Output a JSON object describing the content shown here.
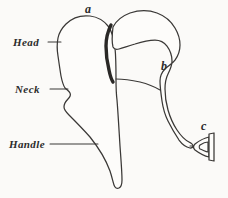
{
  "figure": {
    "background_color": "#fbfaf8",
    "ink_color": "#3a3836",
    "joint_color": "#2a2826",
    "labels": {
      "head": "Head",
      "neck": "Neck",
      "handle": "Handle",
      "letter_a": "a",
      "letter_b": "b",
      "letter_c": "c"
    },
    "parts": {
      "malleus": "malleus-outline",
      "incus": "incus-outline",
      "stapes": "stapes-outline",
      "joint": "incudomallear-joint"
    },
    "icons": {
      "leader_head": "leader-line-icon",
      "leader_neck": "leader-line-icon",
      "leader_handle": "leader-line-icon"
    }
  }
}
